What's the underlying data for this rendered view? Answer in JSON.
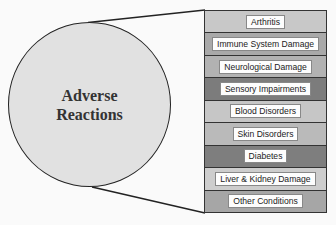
{
  "center": {
    "label": "Adverse\nReactions",
    "fill": "#e1e1e1"
  },
  "items": [
    {
      "label": "Arthritis",
      "color": "#c8c8c8"
    },
    {
      "label": "Immune System Damage",
      "color": "#a9a9a9"
    },
    {
      "label": "Neurological Damage",
      "color": "#b2b2b2"
    },
    {
      "label": "Sensory Impairments",
      "color": "#7c7c7c"
    },
    {
      "label": "Blood Disorders",
      "color": "#c6c6c6"
    },
    {
      "label": "Skin Disorders",
      "color": "#bababa"
    },
    {
      "label": "Diabetes",
      "color": "#7e7e7e"
    },
    {
      "label": "Liver & Kidney Damage",
      "color": "#cdcdcd"
    },
    {
      "label": "Other Conditions",
      "color": "#a6a6a6"
    }
  ]
}
